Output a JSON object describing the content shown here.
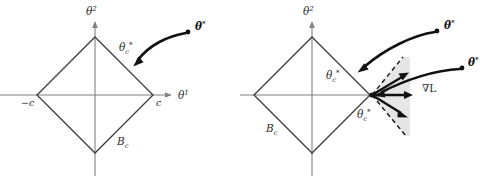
{
  "figure": {
    "width": 480,
    "height": 176,
    "background": "#ffffff",
    "colors": {
      "axis": "#808080",
      "ball_edge": "#3a3a3a",
      "trajectory": "#111111",
      "cone_fill": "#e2e2e2",
      "cone_dash": "#1a1a1a",
      "label": "#2b2b2b"
    }
  },
  "panels": [
    {
      "id": "left",
      "name": "unique-solution-panel",
      "center": {
        "x": 95,
        "y": 95
      },
      "radius": 58,
      "axes": {
        "x_label": "θ",
        "x_superscript": "1",
        "y_label": "θ",
        "y_superscript": "2"
      },
      "labels": {
        "neg_c": "−c",
        "pos_c": "c",
        "ball": "B",
        "ball_sub": "c",
        "theta_star": "θ",
        "theta_star_sup": "*",
        "theta_c": "θ",
        "theta_c_sub": "c",
        "theta_c_sup": "*"
      },
      "points": {
        "theta_star": {
          "x": 188,
          "y": 32
        },
        "theta_c": {
          "x": 133,
          "y": 67
        }
      }
    },
    {
      "id": "right",
      "name": "non-unique-solution-panel",
      "center": {
        "x": 312,
        "y": 95
      },
      "radius": 58,
      "axes": {
        "y_label": "θ",
        "y_superscript": "2"
      },
      "labels": {
        "ball": "B",
        "ball_sub": "c",
        "theta_star_upper": "θ",
        "theta_star_upper_sup": "*",
        "theta_star_lower": "θ",
        "theta_star_lower_sup": "*",
        "theta_c_upper": "θ",
        "theta_c_upper_sub": "c",
        "theta_c_upper_sup": "*",
        "theta_c_lower": "θ",
        "theta_c_lower_sub": "c",
        "theta_c_lower_sup": "*",
        "gradient": "∇L"
      },
      "points": {
        "theta_star_upper": {
          "x": 437,
          "y": 31
        },
        "theta_star_lower": {
          "x": 462,
          "y": 68
        },
        "theta_c_upper": {
          "x": 358,
          "y": 72
        },
        "theta_c_lower": {
          "x": 372,
          "y": 95
        }
      },
      "cone": {
        "apex": {
          "x": 372,
          "y": 95
        },
        "upper_edge": {
          "x": 403,
          "y": 57
        },
        "lower_edge": {
          "x": 406,
          "y": 136
        },
        "fill": "#e2e2e2"
      },
      "gradient_arrows": [
        {
          "from": {
            "x": 372,
            "y": 95
          },
          "to": {
            "x": 408,
            "y": 73
          }
        },
        {
          "from": {
            "x": 372,
            "y": 95
          },
          "to": {
            "x": 412,
            "y": 95
          }
        },
        {
          "from": {
            "x": 372,
            "y": 95
          },
          "to": {
            "x": 407,
            "y": 117
          }
        }
      ]
    }
  ]
}
